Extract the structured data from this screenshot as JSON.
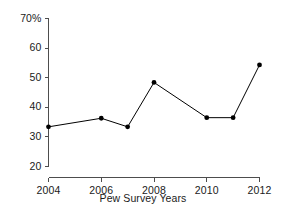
{
  "chart_data": {
    "type": "line",
    "title": "",
    "xlabel": "Pew Survey Years",
    "ylabel": "",
    "x": [
      2004,
      2006,
      2007,
      2008,
      2010,
      2011,
      2012
    ],
    "values": [
      33.4,
      36.3,
      33.4,
      48.4,
      36.5,
      36.5,
      54.3
    ],
    "series": [
      {
        "name": "Pew Survey",
        "values": [
          33.4,
          36.3,
          33.4,
          48.4,
          36.5,
          36.5,
          54.3
        ]
      }
    ],
    "xlim": [
      2004,
      2012
    ],
    "ylim": [
      20,
      70
    ],
    "x_tick_labels": [
      "2004",
      "2006",
      "2008",
      "2010",
      "2012"
    ],
    "x_tick_values": [
      2004,
      2006,
      2008,
      2010,
      2012
    ],
    "y_tick_labels": [
      "20",
      "30",
      "40",
      "50",
      "60",
      "70%"
    ],
    "y_tick_values": [
      20,
      30,
      40,
      50,
      60,
      70
    ],
    "grid": false,
    "legend": false,
    "marker": "filled-circle",
    "line_color": "#000000",
    "marker_color": "#000000",
    "axis_color": "#4d4d4d",
    "background_color": "#ffffff"
  }
}
